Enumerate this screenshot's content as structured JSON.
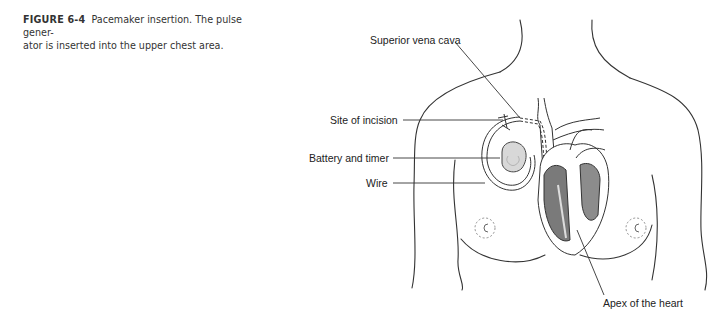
{
  "caption": {
    "figure_number": "FIGURE 6-4",
    "text_line1": "Pacemaker insertion. The pulse gener-",
    "text_line2": "ator is inserted into the upper chest area."
  },
  "labels": {
    "superior_vena_cava": "Superior vena cava",
    "site_of_incision": "Site of incision",
    "battery_and_timer": "Battery and timer",
    "wire": "Wire",
    "apex_of_heart": "Apex of the heart"
  },
  "colors": {
    "outline": "#333333",
    "heart_dark": "#7a7a7a",
    "heart_mid": "#9a9a9a",
    "device_fill": "#d8d8d8",
    "text": "#222222"
  }
}
